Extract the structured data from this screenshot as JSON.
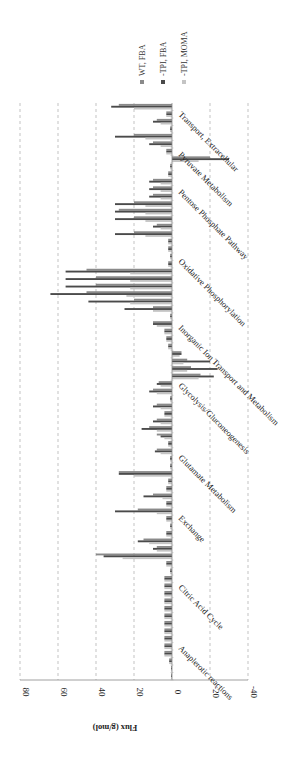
{
  "chart_data": {
    "type": "bar",
    "orientation": "rotated-90-clockwise",
    "title": "",
    "xlabel": "",
    "ylabel": "Flux (g/mol)",
    "ylim": [
      -40,
      80
    ],
    "yticks": [
      80,
      60,
      40,
      20,
      0,
      -20,
      -40
    ],
    "ytick_labels": [
      "80",
      "60",
      "40",
      "20",
      "0",
      "-20",
      "-40"
    ],
    "grid": "dashed horizontal at each y tick",
    "legend_position": "top-right (rotated)",
    "colors": {
      "WT, FBA": "#8a8a8a",
      "-TPI, FBA": "#4a4a4a",
      "-TPI, MOMA": "#c4c4c4"
    },
    "categories": [
      "Anaplerotic reactions",
      "Citric Acid Cycle",
      "Exchange",
      "Glutamate Metabolism",
      "Glycolysis/Gluconeogenesis",
      "Inorganic Ion Transport and Metabolism",
      "Oxidative Phosphorylation",
      "Pentose Phosphate Pathway",
      "Pyruvate Metabolism",
      "Transport, Extracellular"
    ],
    "category_span_fraction": [
      [
        0.0,
        0.06
      ],
      [
        0.06,
        0.21
      ],
      [
        0.21,
        0.3
      ],
      [
        0.3,
        0.42
      ],
      [
        0.42,
        0.55
      ],
      [
        0.55,
        0.62
      ],
      [
        0.62,
        0.78
      ],
      [
        0.78,
        0.86
      ],
      [
        0.86,
        0.91
      ],
      [
        0.91,
        1.0
      ]
    ],
    "series": [
      {
        "name": "WT, FBA",
        "reactions": [
          0.5,
          0.5,
          1.5,
          4,
          4,
          4,
          4,
          4,
          4,
          4,
          4,
          4,
          4,
          4,
          1,
          3,
          40,
          8,
          15,
          3,
          1,
          3,
          18,
          3,
          10,
          3,
          2,
          28,
          1,
          1,
          8,
          2,
          8,
          12,
          8,
          4,
          8,
          1,
          10,
          7,
          -15,
          -10,
          -8,
          -5,
          2,
          3,
          4,
          10,
          1,
          10,
          20,
          45,
          40,
          40,
          45,
          2,
          1,
          2,
          2,
          20,
          8,
          20,
          28,
          20,
          10,
          10,
          10,
          2,
          1,
          -20,
          3,
          10,
          20,
          1,
          8,
          3,
          28
        ]
      },
      {
        "name": "-TPI, FBA",
        "reactions": [
          0.5,
          0.5,
          1.5,
          4,
          4,
          4,
          4,
          4,
          4,
          4,
          4,
          4,
          4,
          4,
          1,
          3,
          36,
          10,
          18,
          3,
          1,
          3,
          30,
          3,
          15,
          3,
          2,
          28,
          1,
          1,
          9,
          2,
          6,
          16,
          10,
          4,
          10,
          1,
          12,
          8,
          -22,
          -24,
          -20,
          -5,
          2,
          3,
          4,
          10,
          1,
          25,
          44,
          64,
          56,
          56,
          56,
          2,
          1,
          2,
          2,
          30,
          10,
          30,
          30,
          30,
          12,
          12,
          12,
          2,
          1,
          -30,
          3,
          12,
          30,
          1,
          10,
          3,
          32
        ]
      },
      {
        "name": "-TPI, MOMA",
        "reactions": [
          0.5,
          0.5,
          1.5,
          4,
          4,
          4,
          4,
          4,
          4,
          4,
          4,
          4,
          4,
          4,
          1,
          3,
          26,
          8,
          12,
          3,
          1,
          3,
          8,
          3,
          5,
          3,
          2,
          20,
          1,
          1,
          6,
          2,
          4,
          8,
          6,
          4,
          6,
          1,
          8,
          6,
          -14,
          -8,
          -6,
          -4,
          2,
          3,
          4,
          8,
          1,
          10,
          22,
          24,
          22,
          22,
          22,
          2,
          1,
          2,
          2,
          14,
          6,
          14,
          14,
          14,
          6,
          6,
          6,
          2,
          1,
          -14,
          3,
          6,
          14,
          1,
          6,
          3,
          20
        ]
      }
    ]
  },
  "legend": {
    "items": [
      {
        "label": "WT, FBA",
        "color": "#8a8a8a"
      },
      {
        "label": "-TPI, FBA",
        "color": "#4a4a4a"
      },
      {
        "label": "-TPI, MOMA",
        "color": "#c4c4c4"
      }
    ]
  }
}
